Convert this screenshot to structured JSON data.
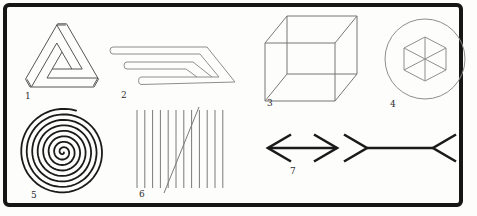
{
  "plate": {
    "type": "scanned-illustration-plate",
    "figures": {
      "penrose": {
        "label": "1"
      },
      "prongs": {
        "label": "2"
      },
      "cube": {
        "label": "3"
      },
      "hex_circle": {
        "label": "4"
      },
      "spiral": {
        "label": "5"
      },
      "parallels": {
        "label": "6"
      },
      "muller_lyer": {
        "label": "7"
      }
    },
    "colors": {
      "frame": "#161616",
      "heavy_ink": "#1a1a1a",
      "medium_ink": "#555555",
      "light_ink": "#8e8e8e",
      "paper": "#fdfdfc"
    },
    "parallels_geometry": {
      "count": 12,
      "x_start": 137,
      "spacing": 7.8,
      "y_top": 110,
      "y_bottom": 188
    },
    "spiral_geometry": {
      "cx": 63,
      "cy": 152,
      "r0": 0.6,
      "growth_per_rad": 0.874,
      "theta_start": 0.4,
      "theta_end": 49.1
    }
  }
}
